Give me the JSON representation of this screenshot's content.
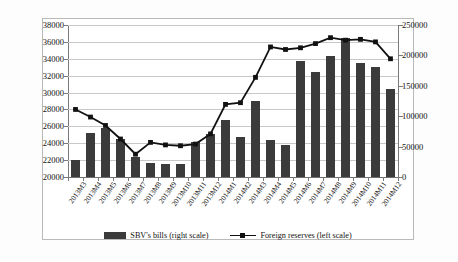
{
  "chart_data": {
    "type": "bar",
    "title": "",
    "subtitle": "",
    "xlabel": "",
    "ylabel_left": "",
    "ylabel_right": "",
    "grid": true,
    "legend_position": "bottom",
    "categories": [
      "2013M3",
      "2013M4",
      "2013M5",
      "2013M6",
      "2013M7",
      "2013M8",
      "2013M9",
      "2013M10",
      "2013M11",
      "2013M12",
      "2014M1",
      "2014M2",
      "2014M3",
      "2014M4",
      "2014M5",
      "2014M6",
      "2014M7",
      "2014M8",
      "2014M9",
      "2014M10",
      "2014M11",
      "2014M12"
    ],
    "left_axis": {
      "min": 20000,
      "max": 38000,
      "step": 2000,
      "ticks": [
        "20000",
        "22000",
        "24000",
        "26000",
        "28000",
        "30000",
        "32000",
        "34000",
        "36000",
        "38000"
      ]
    },
    "right_axis": {
      "min": 0,
      "max": 250000,
      "step": 50000,
      "ticks": [
        "0",
        "50000",
        "100000",
        "150000",
        "200000",
        "250000"
      ]
    },
    "series": [
      {
        "name": "SBV's bills (right scale)",
        "type": "bar",
        "axis": "right",
        "color": "#3b3b3b",
        "values": [
          28000,
          72000,
          80000,
          63000,
          33000,
          23000,
          21000,
          21000,
          57000,
          71000,
          93000,
          65000,
          125000,
          61000,
          52000,
          190000,
          172000,
          199000,
          229000,
          188000,
          181000,
          145000
        ]
      },
      {
        "name": "Foreign reserves (left scale)",
        "type": "line",
        "axis": "left",
        "color": "#111111",
        "marker": "square",
        "values": [
          28000,
          27100,
          26100,
          24500,
          22700,
          24100,
          23800,
          23700,
          23900,
          25100,
          28600,
          28800,
          31800,
          35400,
          35100,
          35300,
          35800,
          36500,
          36200,
          36300,
          36000,
          34000
        ]
      }
    ]
  },
  "legend": {
    "bar_label": "SBV's bills (right scale)",
    "line_label": "Foreign reserves (left scale)"
  }
}
